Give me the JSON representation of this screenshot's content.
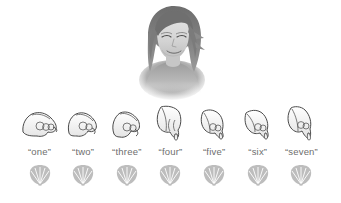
{
  "figure": {
    "name": "counting-with-shells-illustration",
    "background_color": "#ffffff",
    "label_color": "#6e6e6e",
    "ink_color": "#3a3a3a",
    "shell_color": "#b4b4b4"
  },
  "portrait": {
    "alt": "woman-looking-down",
    "hair_color": "#777777",
    "skin_color": "#d9d9d9"
  },
  "counting": {
    "columns": [
      {
        "index": 1,
        "label": "“one”",
        "hand": "pointing-hand-right-1",
        "shell": "scallop-shell"
      },
      {
        "index": 2,
        "label": "“two”",
        "hand": "pointing-hand-right-2",
        "shell": "scallop-shell"
      },
      {
        "index": 3,
        "label": "“three”",
        "hand": "pointing-hand-right-3",
        "shell": "scallop-shell"
      },
      {
        "index": 4,
        "label": "“four”",
        "hand": "pointing-hand-down-4",
        "shell": "scallop-shell"
      },
      {
        "index": 5,
        "label": "“five”",
        "hand": "pointing-hand-down-5",
        "shell": "scallop-shell"
      },
      {
        "index": 6,
        "label": "“six”",
        "hand": "pointing-hand-down-6",
        "shell": "scallop-shell"
      },
      {
        "index": 7,
        "label": "“seven”",
        "hand": "pointing-hand-down-7",
        "shell": "scallop-shell"
      }
    ]
  }
}
